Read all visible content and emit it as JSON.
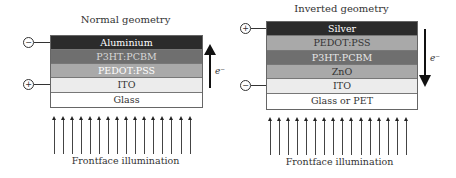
{
  "left": {
    "title": "Normal geometry",
    "layers": [
      {
        "label": "Aluminium",
        "color": "#2b2b2b",
        "text_color": "#ffffff"
      },
      {
        "label": "P3HT:PCBM",
        "color": "#6f6f6f",
        "text_color": "#d8d8d8"
      },
      {
        "label": "PEDOT:PSS",
        "color": "#a9a9a9",
        "text_color": "#ffffff"
      },
      {
        "label": "ITO",
        "color": "#ececec",
        "text_color": "#333333"
      },
      {
        "label": "Glass",
        "color": "#ffffff",
        "text_color": "#333333"
      }
    ],
    "terminals": {
      "top": "−",
      "bottom": "+"
    },
    "electron_label": "e⁻",
    "electron_direction": "up",
    "illumination_label": "Frontface illumination"
  },
  "right": {
    "title": "Inverted geometry",
    "layers": [
      {
        "label": "Silver",
        "color": "#2b2b2b",
        "text_color": "#ffffff"
      },
      {
        "label": "PEDOT:PSS",
        "color": "#a9a9a9",
        "text_color": "#333333"
      },
      {
        "label": "P3HT:PCBM",
        "color": "#6f6f6f",
        "text_color": "#e8e8e8"
      },
      {
        "label": "ZnO",
        "color": "#a9a9a9",
        "text_color": "#333333"
      },
      {
        "label": "ITO",
        "color": "#ececec",
        "text_color": "#333333"
      },
      {
        "label": "Glass or PET",
        "color": "#ffffff",
        "text_color": "#333333"
      }
    ],
    "terminals": {
      "top": "+",
      "bottom": "−"
    },
    "electron_label": "e⁻",
    "electron_direction": "down",
    "illumination_label": "Frontface illumination"
  }
}
